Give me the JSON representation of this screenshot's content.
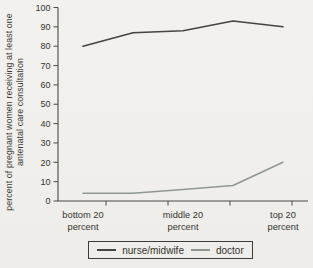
{
  "chart_data": {
    "type": "line",
    "title": "",
    "ylabel": "percent of pregnant women receiving at least one antenatal care consultation",
    "xlabel": "",
    "ylim": [
      0,
      100
    ],
    "y_tick_step": 10,
    "grid": false,
    "legend_position": "bottom",
    "x_labels": [
      {
        "index": 0,
        "lines": [
          "bottom 20",
          "percent"
        ]
      },
      {
        "index": 2,
        "lines": [
          "middle 20",
          "percent"
        ]
      },
      {
        "index": 4,
        "lines": [
          "top 20",
          "percent"
        ]
      }
    ],
    "series": [
      {
        "name": "nurse/midwife",
        "color": "#45443f",
        "values": [
          80,
          87,
          88,
          93,
          90
        ]
      },
      {
        "name": "doctor",
        "color": "#8f978f",
        "values": [
          4,
          4,
          6,
          8,
          20
        ]
      }
    ],
    "colors": {
      "axis": "#4a4a44",
      "text": "#35352f",
      "background": "#f0efeb"
    }
  }
}
